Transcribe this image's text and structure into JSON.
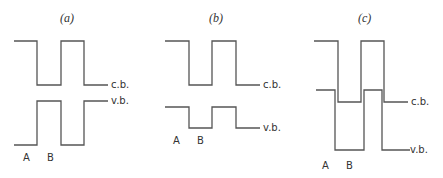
{
  "panels": [
    {
      "title": "(a)",
      "cb_label": "c.b.",
      "vb_label": "v.b.",
      "region_a": "A",
      "region_b": "B"
    },
    {
      "title": "(b)",
      "cb_label": "c.b.",
      "vb_label": "v.b.",
      "region_a": "A",
      "region_b": "B"
    },
    {
      "title": "(c)",
      "cb_label": "c.b.",
      "vb_label": "v.b.",
      "region_a": "A",
      "region_b": "B"
    }
  ],
  "colors": {
    "line": "#555555",
    "text": "#333333",
    "background": "#ffffff"
  }
}
